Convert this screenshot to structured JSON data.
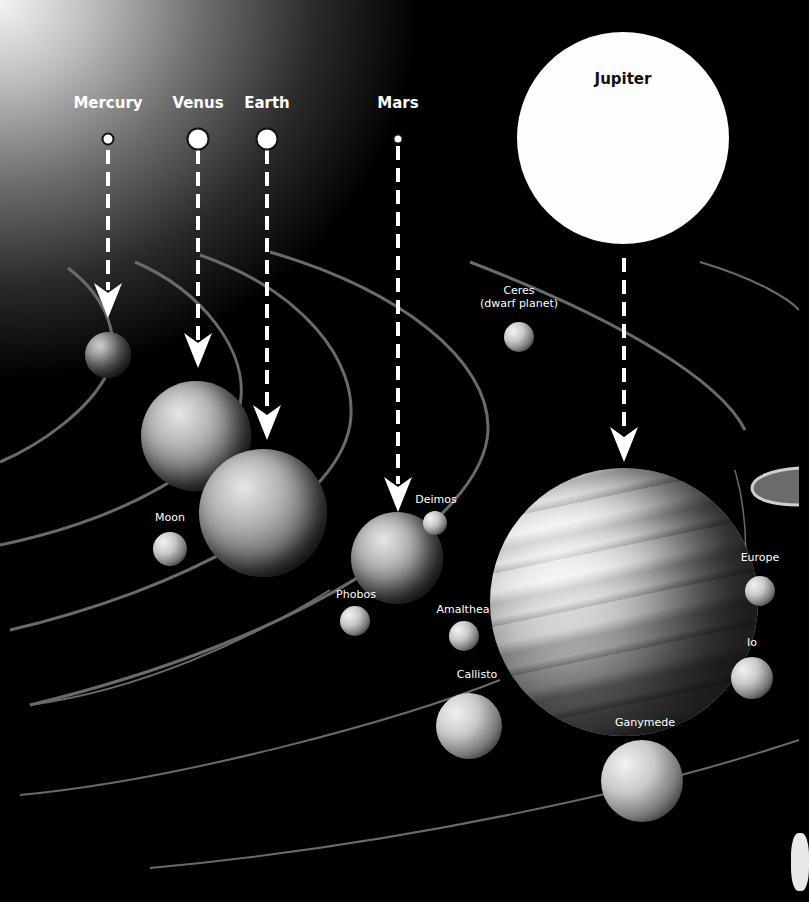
{
  "title_markers": [
    {
      "name": "Mercury",
      "x": 108,
      "label_y": 104,
      "marker_y": 139,
      "marker_d": 13
    },
    {
      "name": "Venus",
      "x": 198,
      "label_y": 104,
      "marker_y": 139,
      "marker_d": 23
    },
    {
      "name": "Earth",
      "x": 267,
      "label_y": 104,
      "marker_y": 139,
      "marker_d": 23
    },
    {
      "name": "Mars",
      "x": 398,
      "label_y": 104,
      "marker_y": 139,
      "marker_d": 11
    }
  ],
  "jupiter_reference": {
    "name": "Jupiter",
    "x": 623,
    "y": 138,
    "diameter": 212
  },
  "planets": [
    {
      "name": "Mercury",
      "x": 108,
      "y": 355,
      "d": 46
    },
    {
      "name": "Venus",
      "x": 196,
      "y": 436,
      "d": 110
    },
    {
      "name": "Earth",
      "x": 263,
      "y": 513,
      "d": 128
    },
    {
      "name": "Mars",
      "x": 397,
      "y": 558,
      "d": 92
    },
    {
      "name": "Jupiter",
      "x": 624,
      "y": 602,
      "d": 268
    }
  ],
  "moons_and_others": [
    {
      "name": "Ceres",
      "caption": "Ceres\n(dwarf planet)",
      "x": 519,
      "y": 337,
      "d": 30,
      "label_x": 519,
      "label_y": 290
    },
    {
      "name": "Moon",
      "caption": "Moon",
      "x": 170,
      "y": 549,
      "d": 34,
      "label_x": 170,
      "label_y": 517
    },
    {
      "name": "Deimos",
      "caption": "Deimos",
      "x": 435,
      "y": 523,
      "d": 24,
      "label_x": 436,
      "label_y": 499
    },
    {
      "name": "Phobos",
      "caption": "Phobos",
      "x": 355,
      "y": 621,
      "d": 30,
      "label_x": 356,
      "label_y": 594
    },
    {
      "name": "Amalthea",
      "caption": "Amalthea",
      "x": 464,
      "y": 636,
      "d": 30,
      "label_x": 463,
      "label_y": 609
    },
    {
      "name": "Callisto",
      "caption": "Callisto",
      "x": 469,
      "y": 726,
      "d": 66,
      "label_x": 477,
      "label_y": 674
    },
    {
      "name": "Ganymede",
      "caption": "Ganymede",
      "x": 642,
      "y": 781,
      "d": 82,
      "label_x": 645,
      "label_y": 722
    },
    {
      "name": "Europe",
      "caption": "Europe",
      "x": 760,
      "y": 591,
      "d": 30,
      "label_x": 760,
      "label_y": 557
    },
    {
      "name": "Io",
      "caption": "Io",
      "x": 752,
      "y": 678,
      "d": 42,
      "label_x": 752,
      "label_y": 642
    }
  ],
  "arrows": [
    {
      "target": "Mercury",
      "x": 108,
      "y1": 150,
      "y2": 315
    },
    {
      "target": "Venus",
      "x": 198,
      "y1": 150,
      "y2": 365
    },
    {
      "target": "Earth",
      "x": 267,
      "y1": 150,
      "y2": 440
    },
    {
      "target": "Mars",
      "x": 398,
      "y1": 146,
      "y2": 510
    },
    {
      "target": "Jupiter",
      "x": 624,
      "y1": 258,
      "y2": 462
    }
  ],
  "colors": {
    "background": "#000000",
    "glow": "#f4f4f4",
    "label": "#ffffff",
    "orbit": "#6a6a6a",
    "arrow": "#ffffff"
  }
}
